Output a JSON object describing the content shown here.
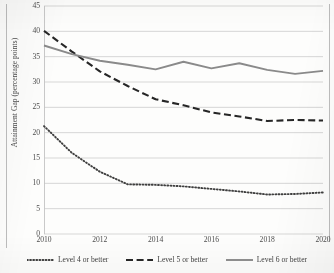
{
  "chart_data": {
    "type": "line",
    "title": "",
    "subtitle": "",
    "xlabel": "",
    "ylabel": "Attainment Gap (percentage points)",
    "x": [
      2010,
      2011,
      2012,
      2013,
      2014,
      2015,
      2016,
      2017,
      2018,
      2019,
      2020
    ],
    "xlim": [
      2010,
      2020
    ],
    "ylim": [
      0,
      45
    ],
    "xticks": [
      "2010",
      "2012",
      "2014",
      "2016",
      "2018",
      "2020"
    ],
    "xtick_values": [
      2010,
      2012,
      2014,
      2016,
      2018,
      2020
    ],
    "yticks": [
      "0",
      "5",
      "10",
      "15",
      "20",
      "25",
      "30",
      "35",
      "40",
      "45"
    ],
    "ytick_values": [
      0,
      5,
      10,
      15,
      20,
      25,
      30,
      35,
      40,
      45
    ],
    "grid": "horizontal",
    "legend_position": "bottom",
    "series": [
      {
        "name": "Level 4 or better",
        "style": "dotted",
        "color": "#3f3f3f",
        "values": [
          21.3,
          16.0,
          12.3,
          9.8,
          9.7,
          9.4,
          8.9,
          8.4,
          7.8,
          7.9,
          8.2
        ]
      },
      {
        "name": "Level 5 or better",
        "style": "dashed",
        "color": "#262626",
        "values": [
          40.1,
          36.0,
          32.1,
          29.2,
          26.6,
          25.4,
          24.0,
          23.2,
          22.3,
          22.5,
          22.4
        ]
      },
      {
        "name": "Level 6 or better",
        "style": "solid",
        "color": "#8a8a8a",
        "values": [
          37.2,
          35.5,
          34.2,
          33.4,
          32.5,
          34.0,
          32.7,
          33.7,
          32.4,
          31.6,
          32.2
        ]
      }
    ]
  },
  "axes": {
    "ylabel": "Attainment Gap (percentage points)"
  },
  "legend": {
    "items": [
      {
        "label": "Level 4 or better",
        "style": "dotted"
      },
      {
        "label": "Level 5 or better",
        "style": "dashed"
      },
      {
        "label": "Level 6 or better",
        "style": "solid"
      }
    ]
  },
  "colors": {
    "grid": "#c6c6c6",
    "axis": "#c0c0c0",
    "level4": "#3f3f3f",
    "level5": "#262626",
    "level6": "#8a8a8a",
    "background": "#fdfdfc"
  }
}
